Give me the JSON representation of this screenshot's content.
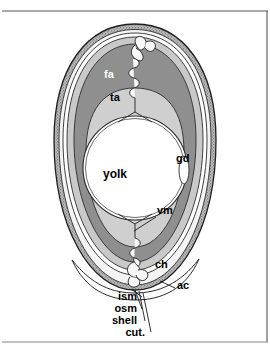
{
  "figure": {
    "type": "anatomical-cross-section",
    "background_color": "#ffffff",
    "frame": {
      "top_rule_color": "#555555",
      "right_rule_color": "#555555",
      "bottom_rule_color": "#888888"
    }
  },
  "palette": {
    "shell_stipple": "#8a8a8a",
    "shell_outline": "#2b2b2b",
    "membrane_white": "#ffffff",
    "outer_albumen": "#c9c9c9",
    "firm_albumen": "#8f8f8f",
    "thin_albumen": "#cfcfcf",
    "yolk": "#ffffff",
    "chalaza": "#f2f2f2",
    "label_dark": "#000000",
    "label_light": "#ffffff",
    "leader_line": "#000000"
  },
  "labels": [
    {
      "id": "fa",
      "text": "fa",
      "meaning": "firm albumen",
      "color": "#ffffff",
      "x": 104,
      "y": 78,
      "size": 11,
      "leader": false
    },
    {
      "id": "ta",
      "text": "ta",
      "meaning": "thin albumen",
      "color": "#000000",
      "x": 110,
      "y": 101,
      "size": 11,
      "leader": false
    },
    {
      "id": "gd",
      "text": "gd",
      "meaning": "germinal disc",
      "color": "#000000",
      "x": 176,
      "y": 162,
      "size": 11,
      "leader": false
    },
    {
      "id": "yolk",
      "text": "yolk",
      "meaning": "yolk",
      "color": "#000000",
      "x": 103,
      "y": 178,
      "size": 12,
      "leader": false
    },
    {
      "id": "vm",
      "text": "vm",
      "meaning": "vitelline membrane",
      "color": "#000000",
      "x": 157,
      "y": 214,
      "size": 11,
      "leader": true
    },
    {
      "id": "ch",
      "text": "ch",
      "meaning": "chalaza",
      "color": "#000000",
      "x": 155,
      "y": 268,
      "size": 11,
      "leader": false
    },
    {
      "id": "ac",
      "text": "ac",
      "meaning": "air cell",
      "color": "#000000",
      "x": 177,
      "y": 289,
      "size": 11,
      "leader": true
    },
    {
      "id": "ism",
      "text": "ism",
      "meaning": "inner shell membrane",
      "color": "#000000",
      "x": 123,
      "y": 300,
      "size": 11,
      "leader": true
    },
    {
      "id": "osm",
      "text": "osm",
      "meaning": "outer shell membrane",
      "color": "#000000",
      "x": 123,
      "y": 312,
      "size": 11,
      "leader": true
    },
    {
      "id": "shell",
      "text": "shell",
      "meaning": "shell",
      "color": "#000000",
      "x": 123,
      "y": 324,
      "size": 11,
      "leader": true
    },
    {
      "id": "cut",
      "text": "cut.",
      "meaning": "cuticle",
      "color": "#000000",
      "x": 123,
      "y": 336,
      "size": 11,
      "leader": true
    }
  ],
  "structures": [
    {
      "id": "cuticle",
      "name": "cuticle"
    },
    {
      "id": "shell",
      "name": "calcified shell"
    },
    {
      "id": "outer-shell-membrane",
      "name": "outer shell membrane"
    },
    {
      "id": "inner-shell-membrane",
      "name": "inner shell membrane"
    },
    {
      "id": "air-cell",
      "name": "air cell"
    },
    {
      "id": "outer-thin-albumen",
      "name": "outer thin albumen"
    },
    {
      "id": "firm-albumen",
      "name": "firm albumen"
    },
    {
      "id": "inner-thin-albumen",
      "name": "inner thin albumen"
    },
    {
      "id": "vitelline-membrane",
      "name": "vitelline membrane"
    },
    {
      "id": "yolk",
      "name": "yolk"
    },
    {
      "id": "germinal-disc",
      "name": "germinal disc"
    },
    {
      "id": "chalaza-upper",
      "name": "upper chalaza"
    },
    {
      "id": "chalaza-lower",
      "name": "lower chalaza"
    }
  ]
}
